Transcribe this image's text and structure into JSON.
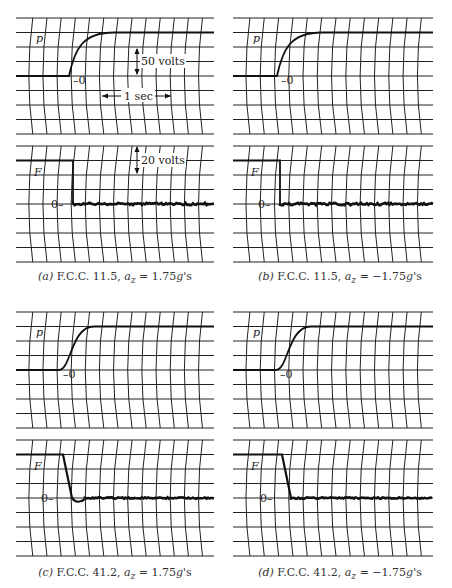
{
  "figure": {
    "panels": [
      {
        "id": "a",
        "caption": {
          "tag": "(a)",
          "body": " F.C.C. 11.5, ",
          "var": "a",
          "sub": "z",
          "rest": " = 1.75",
          "g": "g",
          "tail": "'s"
        },
        "p_label": "p",
        "f_label": "F",
        "zero_label_p": "–0",
        "zero_label_f": "0–",
        "annotations": {
          "p_scale": "50 volts",
          "time_scale": "1 sec",
          "f_scale": "20 volts"
        }
      },
      {
        "id": "b",
        "caption": {
          "tag": "(b)",
          "body": " F.C.C. 11.5, ",
          "var": "a",
          "sub": "z",
          "rest": " = −1.75",
          "g": "g",
          "tail": "'s"
        },
        "p_label": "p",
        "f_label": "F",
        "zero_label_p": "–0",
        "zero_label_f": "0–"
      },
      {
        "id": "c",
        "caption": {
          "tag": "(c)",
          "body": " F.C.C. 41.2, ",
          "var": "a",
          "sub": "z",
          "rest": " = 1.75",
          "g": "g",
          "tail": "'s"
        },
        "p_label": "p",
        "f_label": "F",
        "zero_label_p": "–0",
        "zero_label_f": "0–"
      },
      {
        "id": "d",
        "caption": {
          "tag": "(d)",
          "body": " F.C.C. 41.2, ",
          "var": "a",
          "sub": "z",
          "rest": " = −1.75",
          "g": "g",
          "tail": "'s"
        },
        "p_label": "p",
        "f_label": "F",
        "zero_label_p": "–0",
        "zero_label_f": "0–"
      }
    ]
  },
  "chart_data": [
    {
      "type": "line",
      "title": "(a) F.C.C. 11.5, a_z = 1.75g's",
      "traces": [
        {
          "name": "p",
          "description": "step rise from 0 to ~2 divisions (≈100 volts) over ~0.5 sec, exponential approach",
          "scale": "50 volts/div"
        },
        {
          "name": "F",
          "description": "drops sharply from ~2 divisions (≈40 volts) to 0, then noisy flat at 0",
          "scale": "20 volts/div"
        }
      ],
      "xscale": "1 sec ≈ 4 divisions"
    },
    {
      "type": "line",
      "title": "(b) F.C.C. 11.5, a_z = −1.75g's",
      "traces": [
        {
          "name": "p",
          "description": "step rise from 0 to ~2 divisions, exponential approach"
        },
        {
          "name": "F",
          "description": "sharp drop from ~2 divisions to 0, noisy flat at 0"
        }
      ]
    },
    {
      "type": "line",
      "title": "(c) F.C.C. 41.2, a_z = 1.75g's",
      "traces": [
        {
          "name": "p",
          "description": "S-shaped rise from 0 to ~2 divisions"
        },
        {
          "name": "F",
          "description": "ramp drop from ~2 divisions to 0 with small undershoot, then flat at 0"
        }
      ]
    },
    {
      "type": "line",
      "title": "(d) F.C.C. 41.2, a_z = −1.75g's",
      "traces": [
        {
          "name": "p",
          "description": "S-shaped rise from 0 to ~2 divisions"
        },
        {
          "name": "F",
          "description": "ramp drop from ~2 divisions to 0, flat noisy at 0"
        }
      ]
    }
  ]
}
